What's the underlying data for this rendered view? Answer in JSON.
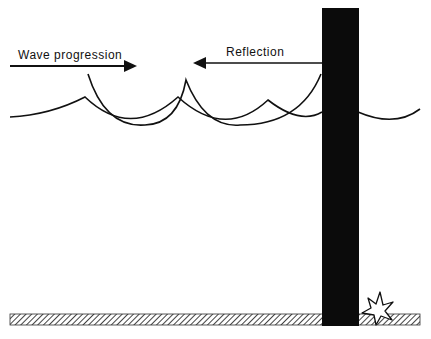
{
  "diagram": {
    "labels": {
      "wave_progression": "Wave progression",
      "reflection": "Reflection"
    },
    "elements": {
      "structure": "vertical-wall",
      "seabed": "hatched-seabed",
      "scour": "star-shaped-scour-mark"
    },
    "colors": {
      "ink": "#111111",
      "background": "#ffffff",
      "hatch": "#555555"
    }
  }
}
